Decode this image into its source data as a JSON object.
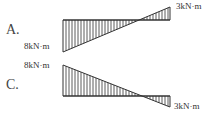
{
  "options": [
    {
      "label": "A.",
      "left_value": "8kN·m",
      "right_value": "3kN·m",
      "left_side": "below",
      "right_side": "above"
    },
    {
      "label": "C.",
      "left_value": "8kN·m",
      "right_value": "3kN·m",
      "left_side": "above",
      "right_side": "below"
    }
  ],
  "colors": {
    "line": "#333333",
    "text": "#444444"
  }
}
